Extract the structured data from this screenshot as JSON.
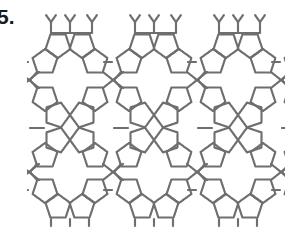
{
  "figure": {
    "label": "5.",
    "bond_color": "#6e6e6e",
    "background": "#ffffff"
  },
  "lattice": {
    "columns": 4,
    "column_period_px": 84,
    "origin_x": 70,
    "pentagon_radius": 13,
    "pentagons": [
      {
        "dx": -12,
        "y": 45,
        "rot": 180
      },
      {
        "dx": 12,
        "y": 45,
        "rot": 180
      },
      {
        "dx": -25,
        "y": 62,
        "rot": 0
      },
      {
        "dx": 25,
        "y": 62,
        "rot": 0
      },
      {
        "dx": -25,
        "y": 98,
        "rot": 180
      },
      {
        "dx": 25,
        "y": 98,
        "rot": 180
      },
      {
        "dx": -13,
        "y": 115,
        "rot": 90
      },
      {
        "dx": 13,
        "y": 115,
        "rot": 270
      },
      {
        "dx": -13,
        "y": 140,
        "rot": 90
      },
      {
        "dx": 13,
        "y": 140,
        "rot": 270
      },
      {
        "dx": -25,
        "y": 156,
        "rot": 0
      },
      {
        "dx": 25,
        "y": 156,
        "rot": 0
      },
      {
        "dx": -25,
        "y": 190,
        "rot": 180
      },
      {
        "dx": 25,
        "y": 190,
        "rot": 180
      },
      {
        "dx": -12,
        "y": 207,
        "rot": 0
      },
      {
        "dx": 12,
        "y": 207,
        "rot": 0
      }
    ],
    "bonds": [
      {
        "x1": -19,
        "y1": 33,
        "x2": 22,
        "y2": 33
      },
      {
        "x1": -19,
        "y1": 33,
        "x2": -19,
        "y2": 22
      },
      {
        "x1": 0,
        "y1": 33,
        "x2": 0,
        "y2": 22
      },
      {
        "x1": 22,
        "y1": 33,
        "x2": 22,
        "y2": 22
      },
      {
        "x1": -19,
        "y1": 22,
        "x2": -24,
        "y2": 15
      },
      {
        "x1": -19,
        "y1": 22,
        "x2": -14,
        "y2": 15
      },
      {
        "x1": 0,
        "y1": 22,
        "x2": -5,
        "y2": 15
      },
      {
        "x1": 0,
        "y1": 22,
        "x2": 5,
        "y2": 15
      },
      {
        "x1": 22,
        "y1": 22,
        "x2": 17,
        "y2": 15
      },
      {
        "x1": 22,
        "y1": 22,
        "x2": 27,
        "y2": 15
      },
      {
        "x1": -40,
        "y1": 80,
        "x2": -33,
        "y2": 72
      },
      {
        "x1": -40,
        "y1": 80,
        "x2": -33,
        "y2": 88
      },
      {
        "x1": 43,
        "y1": 80,
        "x2": 33,
        "y2": 72
      },
      {
        "x1": 43,
        "y1": 80,
        "x2": 33,
        "y2": 88
      },
      {
        "x1": 43,
        "y1": 80,
        "x2": 53,
        "y2": 72
      },
      {
        "x1": 43,
        "y1": 80,
        "x2": 53,
        "y2": 88
      },
      {
        "x1": -40,
        "y1": 172,
        "x2": -33,
        "y2": 164
      },
      {
        "x1": -40,
        "y1": 172,
        "x2": -33,
        "y2": 180
      },
      {
        "x1": 43,
        "y1": 172,
        "x2": 33,
        "y2": 164
      },
      {
        "x1": 43,
        "y1": 172,
        "x2": 33,
        "y2": 180
      },
      {
        "x1": 43,
        "y1": 172,
        "x2": 53,
        "y2": 164
      },
      {
        "x1": 43,
        "y1": 172,
        "x2": 53,
        "y2": 180
      },
      {
        "x1": -26,
        "y1": 128,
        "x2": -40,
        "y2": 128
      },
      {
        "x1": -19,
        "y1": 219,
        "x2": -19,
        "y2": 226
      },
      {
        "x1": 0,
        "y1": 219,
        "x2": 0,
        "y2": 226
      },
      {
        "x1": 19,
        "y1": 219,
        "x2": 19,
        "y2": 226
      },
      {
        "x1": -42,
        "y1": 62,
        "x2": -50,
        "y2": 62
      },
      {
        "x1": -42,
        "y1": 190,
        "x2": -50,
        "y2": 190
      }
    ]
  }
}
